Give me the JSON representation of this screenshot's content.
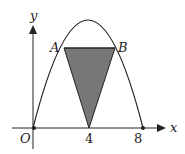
{
  "figure": {
    "axes": {
      "x_label": "x",
      "y_label": "y",
      "origin_label": "O"
    },
    "ticks": {
      "x_tick_1": "4",
      "x_tick_2": "8"
    },
    "points": {
      "A": "A",
      "B": "B"
    },
    "curve": {
      "type": "parabola",
      "x_intercepts": [
        0,
        8
      ],
      "vertex_x": 4
    },
    "shaded_region": {
      "shape": "triangle",
      "vertices": [
        "A",
        "B",
        "(4, 0)"
      ],
      "fill": "#777777"
    },
    "colors": {
      "stroke": "#222222",
      "shade": "#777777"
    }
  }
}
